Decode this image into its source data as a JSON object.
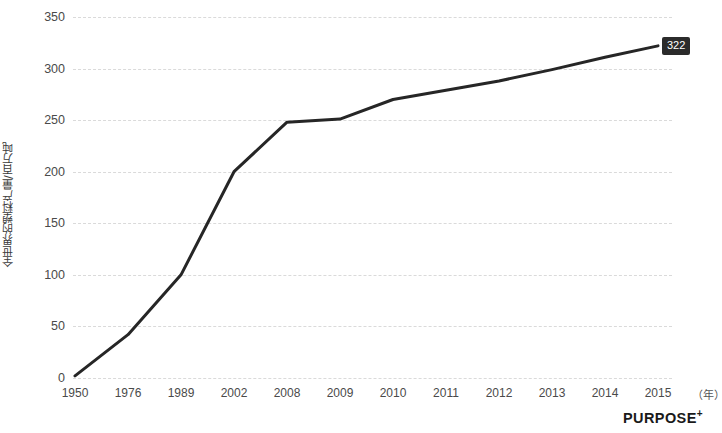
{
  "brand": {
    "name": "PURPOSE",
    "superscript": "+"
  },
  "chart_data": {
    "type": "line",
    "title": "",
    "subtitle": "",
    "xlabel": "（年）",
    "ylabel": "全世界的塑料产量/百万吨",
    "categories": [
      "1950",
      "1976",
      "1989",
      "2002",
      "2008",
      "2009",
      "2010",
      "2011",
      "2012",
      "2013",
      "2014",
      "2015"
    ],
    "values": [
      2,
      42,
      100,
      200,
      248,
      251,
      270,
      279,
      288,
      299,
      311,
      322
    ],
    "x": [
      "1950",
      "1976",
      "1989",
      "2002",
      "2008",
      "2009",
      "2010",
      "2011",
      "2012",
      "2013",
      "2014",
      "2015"
    ],
    "ylim": [
      0,
      350
    ],
    "yticks": [
      350,
      300,
      250,
      200,
      150,
      100,
      50,
      0
    ],
    "ytick_labels": [
      "350",
      "300",
      "250",
      "200",
      "150",
      "100",
      "50",
      "0"
    ],
    "grid": true,
    "grid_axis": "y",
    "grid_style": "dashed",
    "legend": false,
    "legend_position": "none",
    "line_color": "#262626",
    "line_width": 3,
    "markers": false,
    "annotations": [
      {
        "text": "322",
        "category": "2015",
        "value": 322,
        "style": "dark-box-label",
        "background": "#2b2b2b",
        "color": "#ffffff"
      }
    ],
    "colors": {
      "background": "#ffffff",
      "gridline": "#dadada",
      "tick_text": "#4a4a4a",
      "axis_title": "#3a3a3a",
      "line": "#262626",
      "label_bg": "#2b2b2b",
      "label_text": "#ffffff",
      "brand": "#1a1a1a"
    }
  }
}
